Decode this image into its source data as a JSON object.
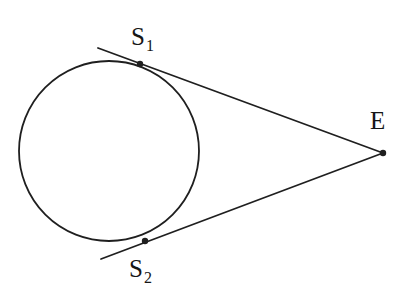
{
  "figure": {
    "background_color": "#ffffff",
    "stroke_color": "#1f1f1f",
    "label_color": "#161616",
    "width": 412,
    "height": 304
  },
  "labels": {
    "s1_main": "S",
    "s1_sub": "1",
    "s2_main": "S",
    "s2_sub": "2",
    "e": "E"
  },
  "chart_data": {
    "type": "diagram",
    "subtype": "euclidean-geometry",
    "coordinate_system": "pixels, origin top-left",
    "circle": {
      "name": "circle",
      "center_x": 109,
      "center_y": 151,
      "radius": 90,
      "stroke_width": 1.8
    },
    "points": [
      {
        "name": "S1",
        "label": "S₁",
        "x": 140,
        "y": 64,
        "marker": "filled-dot",
        "radius": 3.2
      },
      {
        "name": "S2",
        "label": "S₂",
        "x": 145,
        "y": 241,
        "marker": "filled-dot",
        "radius": 3.2
      },
      {
        "name": "E",
        "label": "E",
        "x": 383,
        "y": 153,
        "marker": "filled-dot",
        "radius": 3.2
      }
    ],
    "segments": [
      {
        "name": "tangent-upper",
        "from": "S1-extended",
        "to": "E",
        "x1": 98,
        "y1": 48,
        "x2": 383,
        "y2": 153,
        "stroke_width": 1.8
      },
      {
        "name": "tangent-lower",
        "from": "S2-extended",
        "to": "E",
        "x1": 101,
        "y1": 259,
        "x2": 383,
        "y2": 153,
        "stroke_width": 1.8
      }
    ],
    "label_positions": [
      {
        "name": "S1",
        "x": 131,
        "y": 24
      },
      {
        "name": "S2",
        "x": 129,
        "y": 256
      },
      {
        "name": "E",
        "x": 370,
        "y": 108
      }
    ],
    "grid": false,
    "axes": false,
    "legend": null
  }
}
